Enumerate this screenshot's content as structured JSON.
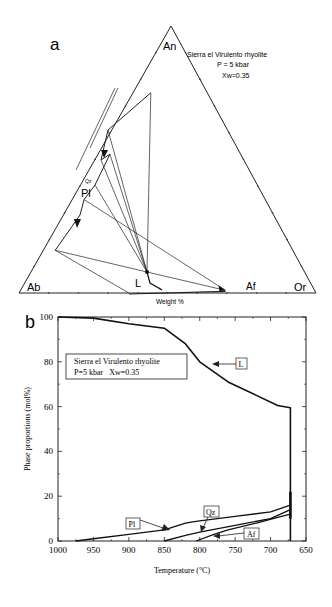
{
  "chart_data": [
    {
      "type": "ternary",
      "panel_label": "a",
      "title_lines": [
        "Sierra el Virulento  rhyolite",
        "P = 5 kbar",
        "Xw=0.35"
      ],
      "apices": {
        "top": "An",
        "left": "Ab",
        "right": "Or"
      },
      "axis_caption": "Weight %",
      "phase_labels": {
        "liquid": "L",
        "alkali_feldspar": "Af",
        "plagioclase": "Pl",
        "quartz": "Qz"
      },
      "points_wt_pct": {
        "liquid_start": {
          "An": 2,
          "Ab": 52,
          "Or": 46
        },
        "liquid_end": {
          "An": 8,
          "Ab": 52,
          "Or": 40
        },
        "afs_end": {
          "An": 1,
          "Ab": 30,
          "Or": 69
        },
        "pl_start": {
          "An": 75,
          "Ab": 19,
          "Or": 6
        },
        "pl_qz_in": {
          "An": 52,
          "Ab": 44,
          "Or": 4
        },
        "pl_afs_in": {
          "An": 35,
          "Ab": 61,
          "Or": 4
        },
        "pl_end": {
          "An": 16,
          "Ab": 80,
          "Or": 4
        },
        "bottom_pl_tie": {
          "An": 0,
          "Ab": 63,
          "Or": 37
        }
      }
    },
    {
      "type": "line",
      "panel_label": "b",
      "legend_box_lines": [
        "Sierra el Virulento rhyolite",
        "P=5 kbar   Xw=0.35"
      ],
      "xlabel": "Temperature (°C)",
      "ylabel": "Phase proportions (mol%)",
      "xlim": [
        1000,
        650
      ],
      "ylim": [
        0,
        100
      ],
      "xticks": [
        1000,
        950,
        900,
        850,
        800,
        750,
        700,
        650
      ],
      "yticks": [
        0,
        20,
        40,
        60,
        80,
        100
      ],
      "series": [
        {
          "name": "L",
          "x": [
            1000,
            950,
            900,
            850,
            820,
            800,
            760,
            720,
            690,
            672,
            672
          ],
          "y": [
            100,
            99.5,
            97,
            95,
            88,
            80,
            71,
            65,
            60.5,
            59.5,
            0
          ]
        },
        {
          "name": "Pl",
          "x": [
            975,
            950,
            900,
            850,
            820,
            810,
            800,
            750,
            700,
            672
          ],
          "y": [
            0,
            1,
            3,
            5,
            8,
            8.5,
            9,
            11,
            13,
            16
          ]
        },
        {
          "name": "Qz",
          "x": [
            850,
            820,
            800,
            750,
            700,
            672
          ],
          "y": [
            0,
            2.5,
            4,
            7,
            10,
            14
          ]
        },
        {
          "name": "Af",
          "x": [
            805,
            780,
            760,
            720,
            690,
            672
          ],
          "y": [
            0,
            3,
            5,
            8,
            10.5,
            12
          ]
        }
      ],
      "annotations": [
        "L",
        "Pl",
        "Qz",
        "Af"
      ]
    }
  ]
}
